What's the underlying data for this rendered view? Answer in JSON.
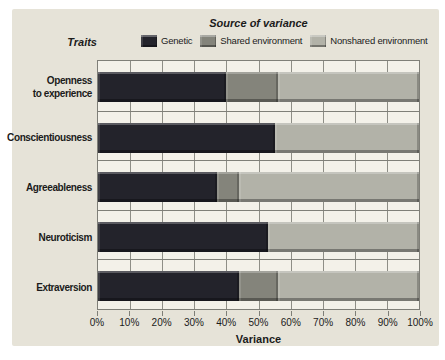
{
  "chart_data": {
    "type": "bar",
    "orientation": "horizontal",
    "stacked": true,
    "title": "Source of variance",
    "ylabel": "Traits",
    "xlabel": "Variance",
    "xlim": [
      0,
      100
    ],
    "grid": true,
    "legend_position": "top",
    "x_ticks": [
      "0%",
      "10%",
      "20%",
      "30%",
      "40%",
      "50%",
      "60%",
      "70%",
      "80%",
      "90%",
      "100%"
    ],
    "categories": [
      "Openness to experience",
      "Conscientiousness",
      "Agreeableness",
      "Neuroticism",
      "Extraversion"
    ],
    "category_display": [
      "Openness\nto experience",
      "Conscientiousness",
      "Agreeableness",
      "Neuroticism",
      "Extraversion"
    ],
    "series": [
      {
        "name": "Genetic",
        "color": "#23232b",
        "values": [
          40,
          55,
          37,
          53,
          44
        ]
      },
      {
        "name": "Shared environment",
        "color": "#84847b",
        "values": [
          16,
          0,
          7,
          0,
          12
        ]
      },
      {
        "name": "Nonshared environment",
        "color": "#b2b2a8",
        "values": [
          44,
          45,
          56,
          47,
          44
        ]
      }
    ]
  },
  "colors": {
    "panel_bg": "#e6e3d8",
    "plot_bg": "#f3f1e9",
    "gridline": "#8e8e86",
    "line": "#7f7f78",
    "text": "#1b1b1b"
  }
}
